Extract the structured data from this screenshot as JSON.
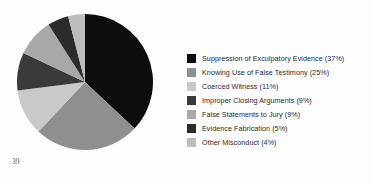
{
  "page": {
    "page_number": "39",
    "background_color": "#fdfdfd"
  },
  "chart_data": {
    "type": "pie",
    "title": "",
    "subtitle": "",
    "xlabel": "",
    "ylabel": "",
    "grid": false,
    "legend_position": "right",
    "start_angle_deg": 0,
    "direction": "clockwise",
    "total_percent": 100,
    "categories": [
      "Suppression of Exculpatory Evidence",
      "Knowing Use of False Testimony",
      "Coerced Witness",
      "Improper Closing Arguments",
      "False Statements to Jury",
      "Evidence Fabrication",
      "Other Misconduct"
    ],
    "values": [
      37,
      25,
      11,
      9,
      9,
      5,
      4
    ],
    "colors": [
      "#0d0d0d",
      "#8f8f8f",
      "#c9c9c9",
      "#3a3a3a",
      "#a8a8a8",
      "#2b2b2b",
      "#bdbdbd"
    ],
    "slices": [
      {
        "label": "Suppression of Exculpatory Evidence",
        "value": 37,
        "percent_text": "37%",
        "color": "#0d0d0d"
      },
      {
        "label": "Knowing Use of False Testimony",
        "value": 25,
        "percent_text": "25%",
        "color": "#8f8f8f"
      },
      {
        "label": "Coerced Witness",
        "value": 11,
        "percent_text": "11%",
        "color": "#c9c9c9"
      },
      {
        "label": "Improper Closing Arguments",
        "value": 9,
        "percent_text": "9%",
        "color": "#3a3a3a"
      },
      {
        "label": "False Statements to Jury",
        "value": 9,
        "percent_text": "9%",
        "color": "#a8a8a8"
      },
      {
        "label": "Evidence Fabrication",
        "value": 5,
        "percent_text": "5%",
        "color": "#2b2b2b"
      },
      {
        "label": "Other Misconduct",
        "value": 4,
        "percent_text": "4%",
        "color": "#bdbdbd"
      }
    ]
  },
  "legend": {
    "items": [
      {
        "text": "Suppression of Exculpatory Evidence (37%)",
        "color": "#0d0d0d"
      },
      {
        "text": "Knowing Use of False Testimony (25%)",
        "color": "#8f8f8f"
      },
      {
        "text": "Coerced Witness (11%)",
        "color": "#c9c9c9"
      },
      {
        "text": "Improper Closing Arguments (9%)",
        "color": "#3a3a3a"
      },
      {
        "text": "False Statements to Jury (9%)",
        "color": "#a8a8a8"
      },
      {
        "text": "Evidence Fabrication (5%)",
        "color": "#2b2b2b"
      },
      {
        "text": "Other Misconduct (4%)",
        "color": "#bdbdbd"
      }
    ]
  }
}
